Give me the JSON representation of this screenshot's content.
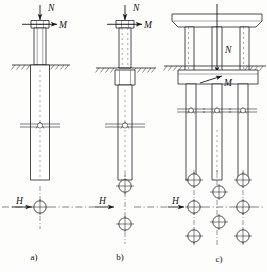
{
  "figure": {
    "background_color": "#fdfdfc",
    "line_color": "#1e1e1e",
    "panels": [
      {
        "id": "a",
        "caption": "a)",
        "type": "single-pile-uniform-shaft",
        "elevation": {
          "load_labels": [
            {
              "name": "N",
              "text": "N",
              "direction": "vertical-down",
              "description": "axial load on pile cap"
            },
            {
              "name": "M",
              "text": "M",
              "direction": "horizontal-right",
              "description": "moment/lateral load at pile head"
            }
          ],
          "ground_line": "hatched ground surface",
          "shaft": "uniform diameter shaft extending below ground",
          "section_marker": "break/section symbol on shaft"
        },
        "plan": {
          "lateral_load_label": "H",
          "pile_count": 1,
          "layout": "single circular pile on centerline",
          "circles": [
            {
              "cx": 40,
              "cy": 207
            }
          ]
        }
      },
      {
        "id": "b",
        "caption": "b)",
        "type": "single-pile-enlarged-upper-shaft",
        "elevation": {
          "load_labels": [
            {
              "name": "N",
              "text": "N",
              "direction": "vertical-down",
              "description": "axial load on pile cap"
            },
            {
              "name": "M",
              "text": "M",
              "direction": "horizontal-right",
              "description": "moment/lateral load at pile head"
            }
          ],
          "ground_line": "hatched ground surface",
          "shaft": "enlarged collar just below ground, narrower shaft below",
          "section_marker": "break/section symbol on shaft"
        },
        "plan": {
          "lateral_load_label": "H",
          "pile_count": 2,
          "layout": "two circular piles in a row perpendicular to H",
          "circles": [
            {
              "cx": 125,
              "cy": 186
            },
            {
              "cx": 125,
              "cy": 224
            }
          ]
        }
      },
      {
        "id": "c",
        "caption": "c)",
        "type": "pile-group-with-pier-cap",
        "elevation": {
          "load_labels": [
            {
              "name": "N",
              "text": "N",
              "direction": "vertical-down",
              "description": "axial load through pier centerline"
            },
            {
              "name": "M",
              "text": "M",
              "direction": "horizontal-right",
              "description": "moment at pile cap level"
            }
          ],
          "ground_line": "hatched ground surface",
          "pier_cap": "tapered bridge cap beam at top",
          "columns": 3,
          "pile_cap": "rectangular pile cap at ground level",
          "piles": 3,
          "section_marker": "break/section symbols on piles"
        },
        "plan": {
          "lateral_load_label": "H",
          "pile_count": 8,
          "layout": "staggered pile group: three in left column, two in middle column, three in right column",
          "circles": [
            {
              "cx": 194,
              "cy": 180
            },
            {
              "cx": 194,
              "cy": 207
            },
            {
              "cx": 194,
              "cy": 236
            },
            {
              "cx": 220,
              "cy": 192
            },
            {
              "cx": 220,
              "cy": 222
            },
            {
              "cx": 243,
              "cy": 180
            },
            {
              "cx": 243,
              "cy": 207
            },
            {
              "cx": 243,
              "cy": 236
            }
          ]
        }
      }
    ],
    "shared": {
      "centerline_style": "dash-dot",
      "centerline_y": 207,
      "lateral_load_symbol": "H",
      "axial_load_symbol": "N",
      "moment_symbol": "M"
    }
  }
}
